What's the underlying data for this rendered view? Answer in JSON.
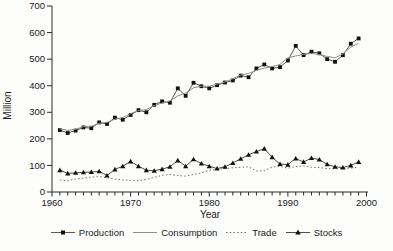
{
  "figure": {
    "background": "#fdfdfc",
    "axis_color": "#2b2b2b",
    "text_color": "#1a1a1a"
  },
  "chart_data": {
    "type": "line",
    "title": "",
    "xlabel": "Year",
    "ylabel": "Million",
    "grid": false,
    "legend_position": "bottom",
    "x_range": [
      1960,
      2000
    ],
    "y_range": [
      0,
      700
    ],
    "y_ticks": [
      0,
      100,
      200,
      300,
      400,
      500,
      600,
      700
    ],
    "x_major_ticks": [
      1960,
      1970,
      1980,
      1990,
      2000
    ],
    "x_minor_tick_interval": 1,
    "x": [
      1961,
      1962,
      1963,
      1964,
      1965,
      1966,
      1967,
      1968,
      1969,
      1970,
      1971,
      1972,
      1973,
      1974,
      1975,
      1976,
      1977,
      1978,
      1979,
      1980,
      1981,
      1982,
      1983,
      1984,
      1985,
      1986,
      1987,
      1988,
      1989,
      1990,
      1991,
      1992,
      1993,
      1994,
      1995,
      1996,
      1997,
      1998,
      1999
    ],
    "series": [
      {
        "name": "Production",
        "marker": "square",
        "line_style": "solid",
        "line_color": "#5a5a5a",
        "marker_color": "#111111",
        "values": [
          233,
          222,
          231,
          243,
          240,
          262,
          256,
          280,
          272,
          290,
          308,
          300,
          328,
          341,
          336,
          390,
          362,
          411,
          398,
          390,
          402,
          412,
          420,
          438,
          432,
          465,
          480,
          465,
          470,
          495,
          550,
          515,
          528,
          522,
          500,
          490,
          515,
          558,
          578
        ]
      },
      {
        "name": "Consumption",
        "marker": "none",
        "line_style": "solid",
        "line_color": "#8c8c8c",
        "marker_color": "#8c8c8c",
        "values": [
          238,
          232,
          236,
          246,
          248,
          258,
          262,
          274,
          280,
          295,
          306,
          310,
          325,
          335,
          342,
          362,
          372,
          392,
          398,
          398,
          406,
          414,
          426,
          440,
          446,
          458,
          466,
          472,
          480,
          505,
          512,
          518,
          522,
          518,
          510,
          505,
          520,
          545,
          560
        ]
      },
      {
        "name": "Trade",
        "marker": "none",
        "line_style": "dotted",
        "line_color": "#6e6e6e",
        "marker_color": "#6e6e6e",
        "values": [
          45,
          42,
          48,
          52,
          56,
          58,
          54,
          48,
          45,
          44,
          42,
          47,
          55,
          63,
          66,
          62,
          60,
          66,
          72,
          82,
          85,
          88,
          91,
          93,
          95,
          79,
          80,
          94,
          96,
          90,
          96,
          98,
          93,
          92,
          88,
          87,
          89,
          90,
          93
        ]
      },
      {
        "name": "Stocks",
        "marker": "triangle",
        "line_style": "solid",
        "line_color": "#4d4d4d",
        "marker_color": "#111111",
        "values": [
          82,
          70,
          72,
          74,
          75,
          78,
          62,
          85,
          97,
          115,
          97,
          82,
          80,
          86,
          95,
          119,
          97,
          123,
          107,
          97,
          88,
          95,
          109,
          125,
          140,
          152,
          163,
          131,
          105,
          103,
          126,
          113,
          128,
          122,
          104,
          95,
          92,
          100,
          113
        ]
      }
    ]
  }
}
